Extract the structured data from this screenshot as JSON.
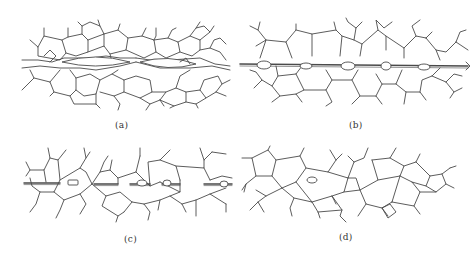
{
  "figure": {
    "line_color": "#4a4a4a",
    "background": "#ffffff",
    "panels": [
      {
        "id": "a",
        "label": "(a)",
        "stage": "open crack along grain boundaries with lenticular gaps"
      },
      {
        "id": "b",
        "label": "(b)",
        "stage": "crack narrowed to a thin channel with lens-shaped pores at grain junctions"
      },
      {
        "id": "c",
        "label": "(c)",
        "stage": "channel breaking up into isolated pores; one pore enclosed within a grain"
      },
      {
        "id": "d",
        "label": "(d)",
        "stage": "crack fully healed; single isolated intragranular pore remains"
      }
    ]
  }
}
